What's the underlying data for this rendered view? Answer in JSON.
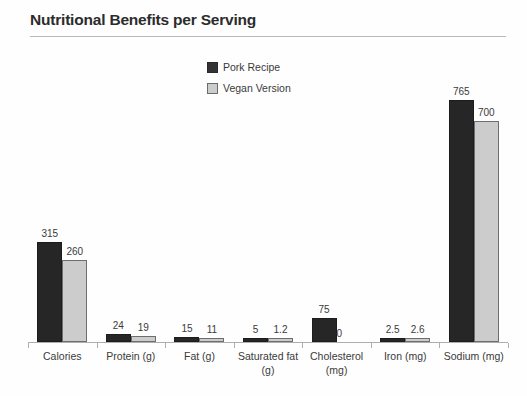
{
  "chart_data": {
    "type": "bar",
    "title": "Nutritional Benefits per Serving",
    "xlabel": "",
    "ylabel": "",
    "grid": false,
    "legend_position": "top-center",
    "axis_max": 765,
    "categories": [
      "Calories",
      "Protein (g)",
      "Fat (g)",
      "Saturated fat (g)",
      "Cholesterol (mg)",
      "Iron (mg)",
      "Sodium (mg)"
    ],
    "category_lines": [
      [
        "Calories"
      ],
      [
        "Protein (g)"
      ],
      [
        "Fat (g)"
      ],
      [
        "Saturated fat",
        "(g)"
      ],
      [
        "Cholesterol",
        "(mg)"
      ],
      [
        "Iron (mg)"
      ],
      [
        "Sodium (mg)"
      ]
    ],
    "series": [
      {
        "name": "Pork Recipe",
        "color": "#262626",
        "values": [
          315,
          24,
          15,
          5,
          75,
          2.5,
          765
        ],
        "labels": [
          "315",
          "24",
          "15",
          "5",
          "75",
          "2.5",
          "765"
        ]
      },
      {
        "name": "Vegan Version",
        "color": "#cccccc",
        "values": [
          260,
          19,
          11,
          1.2,
          0,
          2.6,
          700
        ],
        "labels": [
          "260",
          "19",
          "11",
          "1.2",
          "0",
          "2.6",
          "700"
        ]
      }
    ]
  },
  "legend": {
    "items": [
      {
        "label": "Pork Recipe",
        "swatch": "series-a"
      },
      {
        "label": "Vegan Version",
        "swatch": "series-b"
      }
    ]
  }
}
